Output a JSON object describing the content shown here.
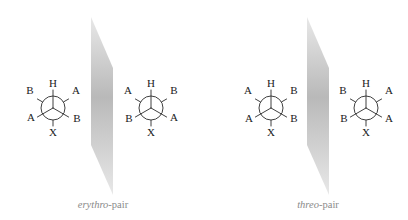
{
  "figure": {
    "colors": {
      "ink": "#2a2a2a",
      "caption": "#8a8a8a",
      "mirror_dark": "#b9b9b9",
      "mirror_light": "#e8e8e8"
    }
  },
  "pairs": [
    {
      "caption_italic": "erythro",
      "caption_rest": "-pair",
      "mirror": {
        "points": "91,17 113,68 113,195 91,145"
      },
      "projections": [
        {
          "center": [
            53,
            108
          ],
          "front": {
            "top": "H",
            "lower_left": "A",
            "lower_right": "B"
          },
          "back": {
            "upper_left": "B",
            "upper_right": "A",
            "bottom": "X"
          }
        },
        {
          "center": [
            151,
            108
          ],
          "front": {
            "top": "H",
            "lower_left": "B",
            "lower_right": "A"
          },
          "back": {
            "upper_left": "A",
            "upper_right": "B",
            "bottom": "X"
          }
        }
      ]
    },
    {
      "caption_italic": "threo",
      "caption_rest": "-pair",
      "mirror": {
        "points": "307,17 329,68 329,195 307,145"
      },
      "projections": [
        {
          "center": [
            271,
            108
          ],
          "front": {
            "top": "H",
            "lower_left": "A",
            "lower_right": "B"
          },
          "back": {
            "upper_left": "A",
            "upper_right": "B",
            "bottom": "X"
          }
        },
        {
          "center": [
            366,
            108
          ],
          "front": {
            "top": "H",
            "lower_left": "B",
            "lower_right": "A"
          },
          "back": {
            "upper_left": "B",
            "upper_right": "A",
            "bottom": "X"
          }
        }
      ]
    }
  ]
}
